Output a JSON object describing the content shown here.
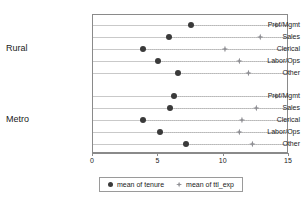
{
  "chart_data": {
    "type": "scatter",
    "title": "",
    "xlabel": "",
    "ylabel": "",
    "xlim": [
      0,
      15
    ],
    "xticks": [
      0,
      5,
      10,
      15
    ],
    "xtick_labels": [
      "0",
      "5",
      "10",
      "15"
    ],
    "grid": true,
    "legend_position": "bottom",
    "groups": [
      {
        "name": "Rural",
        "categories": [
          "Prof/Mgmt",
          "Sales",
          "Clerical",
          "Labor/Ops",
          "Other"
        ]
      },
      {
        "name": "Metro",
        "categories": [
          "Prof/Mgmt",
          "Sales",
          "Clerical",
          "Labor/Ops",
          "Other"
        ]
      }
    ],
    "categories": [
      "Rural Prof/Mgmt",
      "Rural Sales",
      "Rural Clerical",
      "Rural Labor/Ops",
      "Rural Other",
      "Metro Prof/Mgmt",
      "Metro Sales",
      "Metro Clerical",
      "Metro Labor/Ops",
      "Metro Other"
    ],
    "series": [
      {
        "name": "mean of tenure",
        "marker": "circle",
        "color": "#3a3a3a",
        "values": [
          7.5,
          5.8,
          3.8,
          5.0,
          6.5,
          6.2,
          5.9,
          3.8,
          5.1,
          7.1
        ]
      },
      {
        "name": "mean of ttl_exp",
        "marker": "diamond",
        "color": "#8e8e93",
        "values": [
          14.0,
          12.8,
          10.1,
          11.2,
          11.9,
          14.0,
          12.5,
          11.4,
          11.2,
          12.2
        ]
      }
    ]
  },
  "legend": {
    "entries": [
      {
        "label": "mean of tenure"
      },
      {
        "label": "mean of ttl_exp"
      }
    ]
  }
}
